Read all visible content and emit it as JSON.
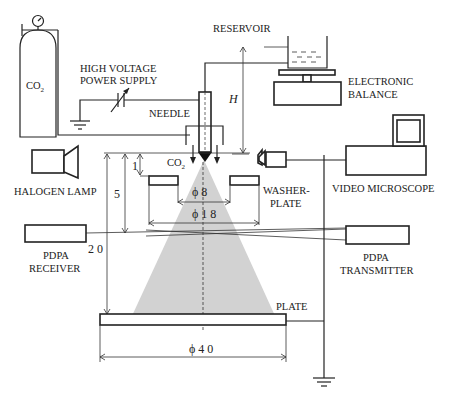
{
  "diagram": {
    "type": "experimental-apparatus-schematic",
    "labels": {
      "co2_cylinder": "CO",
      "co2_sub": "2",
      "high_voltage_line1": "HIGH VOLTAGE",
      "high_voltage_line2": "POWER SUPPLY",
      "reservoir": "RESERVOIR",
      "balance_line1": "ELECTRONIC",
      "balance_line2": "BALANCE",
      "needle": "NEEDLE",
      "height": "H",
      "co2_flow": "CO",
      "co2_flow_sub": "2",
      "halogen_lamp": "HALOGEN LAMP",
      "video_microscope": "VIDEO MICROSCOPE",
      "washer_line1": "WASHER-",
      "washer_line2": "PLATE",
      "receiver_line1": "PDPA",
      "receiver_line2": "RECEIVER",
      "transmitter_line1": "PDPA",
      "transmitter_line2": "TRANSMITTER",
      "plate": "PLATE"
    },
    "dimensions": {
      "d1": "1",
      "d5": "5",
      "d20": "2 0",
      "phi8": "ϕ 8",
      "phi18": "ϕ 1 8",
      "phi40": "ϕ 4 0"
    },
    "colors": {
      "line": "#222222",
      "spray": "#cfcfcf",
      "background": "#ffffff"
    }
  }
}
